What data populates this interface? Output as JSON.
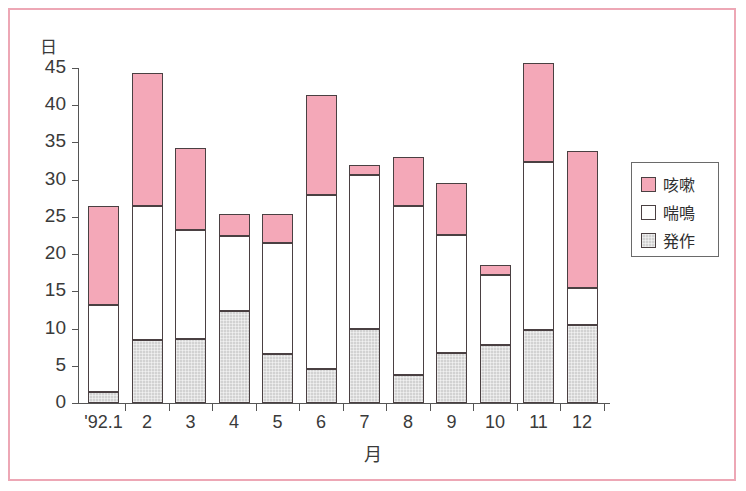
{
  "chart_data": {
    "type": "bar",
    "stacked": true,
    "title": "",
    "xlabel": "月",
    "ylabel": "日",
    "ylim": [
      0,
      45
    ],
    "ytick_values": [
      0,
      5,
      10,
      15,
      20,
      25,
      30,
      35,
      40,
      45
    ],
    "ytick_labels": [
      "0",
      "5",
      "10",
      "15",
      "20",
      "25",
      "30",
      "35",
      "40",
      "45"
    ],
    "categories": [
      "'92.1",
      "2",
      "3",
      "4",
      "5",
      "6",
      "7",
      "8",
      "9",
      "10",
      "11",
      "12"
    ],
    "grid": false,
    "legend_position": "right",
    "series": [
      {
        "name": "発作",
        "color": "#d2d2d2",
        "values": [
          1.5,
          8.4,
          8.6,
          12.4,
          6.6,
          4.6,
          9.9,
          3.8,
          6.7,
          7.8,
          9.8,
          10.5
        ]
      },
      {
        "name": "喘鳴",
        "color": "#ffffff",
        "values": [
          11.7,
          18.1,
          14.6,
          10.0,
          14.9,
          23.4,
          20.7,
          22.7,
          15.9,
          9.4,
          22.6,
          4.9
        ]
      },
      {
        "name": "咳嗽",
        "color": "#f4a8b8",
        "values": [
          13.3,
          17.8,
          11.1,
          3.0,
          3.9,
          13.4,
          1.4,
          6.5,
          6.9,
          1.3,
          13.3,
          18.4
        ]
      }
    ],
    "totals": [
      26.5,
      44.3,
      34.3,
      25.4,
      25.4,
      41.4,
      32.0,
      33.0,
      29.5,
      18.5,
      45.7,
      33.8
    ],
    "cumulative_tops": {
      "hossa": [
        1.5,
        8.4,
        8.6,
        12.4,
        6.6,
        4.6,
        9.9,
        3.8,
        6.7,
        7.8,
        9.8,
        10.5
      ],
      "zenmei": [
        13.2,
        26.5,
        23.2,
        22.4,
        21.5,
        28.0,
        30.6,
        26.5,
        22.6,
        17.2,
        32.4,
        15.4
      ],
      "kough": [
        26.5,
        44.3,
        34.3,
        25.4,
        25.4,
        41.4,
        32.0,
        33.0,
        29.5,
        18.5,
        45.7,
        33.8
      ]
    }
  },
  "legend": {
    "items": [
      {
        "label": "咳嗽",
        "key": "kough"
      },
      {
        "label": "喘鳴",
        "key": "zenmei"
      },
      {
        "label": "発作",
        "key": "hossa"
      }
    ]
  },
  "colors": {
    "frame_border": "#eda7b5",
    "pink": "#f4a8b8",
    "white": "#ffffff",
    "gray": "#d2d2d2",
    "outline": "#4a4042",
    "axis": "#555555",
    "text": "#3a3a3a"
  }
}
